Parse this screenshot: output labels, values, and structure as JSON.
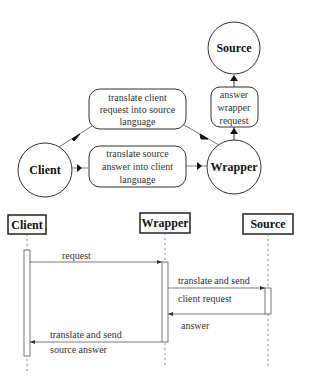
{
  "flow_diagram": {
    "nodes": {
      "source": "Source",
      "client": "Client",
      "wrapper": "Wrapper"
    },
    "boxes": {
      "translate_request": [
        "translate client",
        "request into source",
        "language"
      ],
      "translate_answer": [
        "translate source",
        "answer into client",
        "language"
      ],
      "answer_request": [
        "answer",
        "wrapper",
        "request"
      ]
    }
  },
  "sequence_diagram": {
    "lifelines": {
      "client": "Client",
      "wrapper": "Wrapper",
      "source": "Source"
    },
    "messages": {
      "request": "request",
      "translate_send_1": "translate and send",
      "client_request": "client request",
      "answer": "answer",
      "translate_send_2": "translate and send",
      "source_answer": "source answer"
    }
  }
}
